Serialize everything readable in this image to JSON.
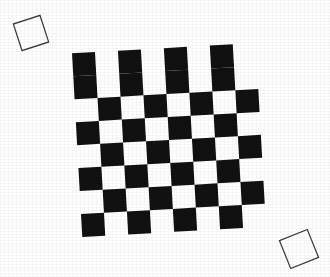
{
  "image": {
    "title": "Rotated checkerboard calibration pattern",
    "description": "A black-and-white 8x8 checkerboard rotated slightly counter-clockwise on a white background, with two small rotated square outlines at the upper-left and lower-right corners.",
    "width": 330,
    "height": 277,
    "background_color": "#ffffff"
  },
  "checkerboard": {
    "name": "checkerboard",
    "rows": 8,
    "columns": 8,
    "cell_size_px": 23,
    "origin_x": 77,
    "origin_y": 48,
    "rotation_degrees": -3.2,
    "top_left_cell_color": "dark",
    "dark_color": "#111111",
    "light_color": "#ffffff",
    "pattern": [
      [
        "dark",
        "light",
        "dark",
        "light",
        "dark",
        "light",
        "dark",
        "light"
      ],
      [
        "dark",
        "light",
        "dark",
        "light",
        "dark",
        "light",
        "dark",
        "light"
      ],
      [
        "light",
        "dark",
        "light",
        "dark",
        "light",
        "dark",
        "light",
        "dark"
      ],
      [
        "dark",
        "light",
        "dark",
        "light",
        "dark",
        "light",
        "dark",
        "light"
      ],
      [
        "light",
        "dark",
        "light",
        "dark",
        "light",
        "dark",
        "light",
        "dark"
      ],
      [
        "dark",
        "light",
        "dark",
        "light",
        "dark",
        "light",
        "dark",
        "light"
      ],
      [
        "light",
        "dark",
        "light",
        "dark",
        "light",
        "dark",
        "light",
        "dark"
      ],
      [
        "dark",
        "light",
        "dark",
        "light",
        "dark",
        "light",
        "dark",
        "light"
      ]
    ]
  },
  "markers": [
    {
      "name": "marker-top-left",
      "center_x": 31,
      "center_y": 33,
      "size_px": 28,
      "rotation_degrees": -18,
      "stroke_color": "#3b3b3b",
      "fill_color": "#ffffff"
    },
    {
      "name": "marker-bottom-right",
      "center_x": 299,
      "center_y": 249,
      "size_px": 30,
      "rotation_degrees": -22,
      "stroke_color": "#3b3b3b",
      "fill_color": "#ffffff"
    }
  ]
}
